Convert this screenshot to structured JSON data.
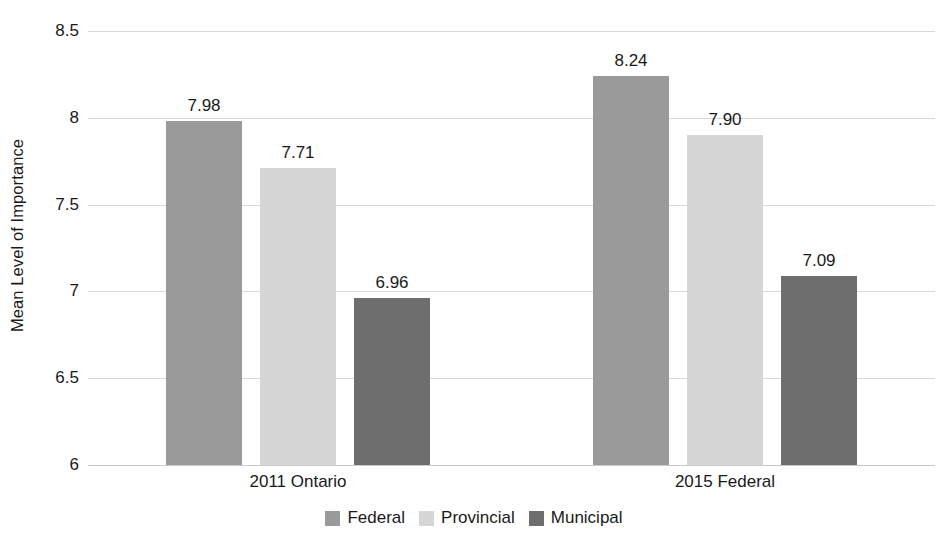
{
  "chart_data": {
    "type": "bar",
    "title": "",
    "subtitle": "",
    "xlabel": "",
    "ylabel": "Mean Level of Importance",
    "categories": [
      "2011 Ontario",
      "2015 Federal"
    ],
    "series": [
      {
        "name": "Federal",
        "values": [
          7.98,
          7.71
        ],
        "color": "#9a9a9a"
      },
      {
        "name": "Provincial",
        "values": [
          7.71,
          7.9
        ],
        "color": "#d6d6d6"
      },
      {
        "name": "Municipal",
        "values": [
          6.96,
          7.09
        ],
        "color": "#6e6e6e"
      }
    ],
    "bars": [
      {
        "group": "2011 Ontario",
        "series": "Federal",
        "value": 7.98,
        "label": "7.98",
        "color": "#9a9a9a"
      },
      {
        "group": "2011 Ontario",
        "series": "Provincial",
        "value": 7.71,
        "label": "7.71",
        "color": "#d6d6d6"
      },
      {
        "group": "2011 Ontario",
        "series": "Municipal",
        "value": 6.96,
        "label": "6.96",
        "color": "#6e6e6e"
      },
      {
        "group": "2015 Federal",
        "series": "Federal",
        "value": 8.24,
        "label": "8.24",
        "color": "#9a9a9a"
      },
      {
        "group": "2015 Federal",
        "series": "Provincial",
        "value": 7.9,
        "label": "7.90",
        "color": "#d6d6d6"
      },
      {
        "group": "2015 Federal",
        "series": "Municipal",
        "value": 7.09,
        "label": "7.09",
        "color": "#6e6e6e"
      }
    ],
    "ylim": [
      6,
      8.5
    ],
    "yticks": [
      6,
      6.5,
      7,
      7.5,
      8,
      8.5
    ],
    "ytick_labels": [
      "6",
      "6.5",
      "7",
      "7.5",
      "8",
      "8.5"
    ],
    "grid": true,
    "grid_axis": "y",
    "legend_position": "bottom",
    "data_labels": true,
    "background_color": "#ffffff",
    "gridline_color": "#d9d9d9",
    "text_color": "#1a1a1a"
  }
}
